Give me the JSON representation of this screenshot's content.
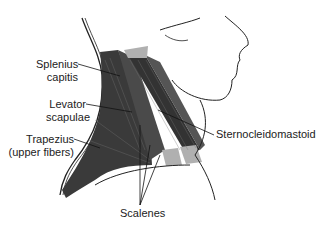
{
  "diagram": {
    "labels": {
      "splenius_capitis_line1": "Splenius",
      "splenius_capitis_line2": "capitis",
      "levator_scapulae_line1": "Levator",
      "levator_scapulae_line2": "scapulae",
      "trapezius_line1": "Trapezius",
      "trapezius_line2": "(upper fibers)",
      "sternocleidomastoid": "Sternocleidomastoid",
      "scalenes": "Scalenes"
    },
    "colors": {
      "muscle_dark": "#3a3a3a",
      "muscle_mid": "#555555",
      "tendon": "#b0b0b0",
      "outline": "#222222",
      "background": "#ffffff"
    }
  }
}
